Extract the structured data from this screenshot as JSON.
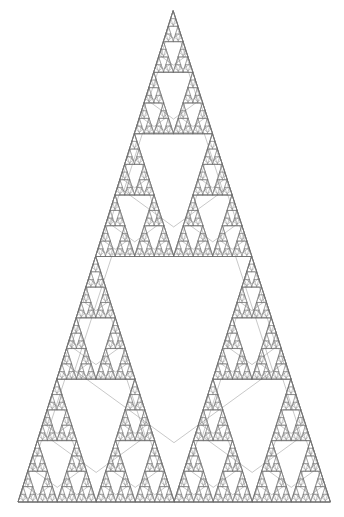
{
  "figure": {
    "type": "fractal-line-drawing",
    "canvas": {
      "width": 344,
      "height": 517,
      "background": "#ffffff"
    },
    "stroke": {
      "color": "#6e6e6e",
      "width": 0.38,
      "linejoin": "round",
      "linecap": "round"
    },
    "geometry": {
      "apex": {
        "x": 173.0,
        "y": 11.0
      },
      "base_left": {
        "x": 18.0,
        "y": 502.0
      },
      "base_right": {
        "x": 330.0,
        "y": 502.0
      },
      "shape": "isosceles-triangle",
      "base_width": 312,
      "height": 491
    },
    "recursion": {
      "depth": 6,
      "rule": "each triangle splits into 3 corner sub-triangles with a central pentagon void",
      "children_per_node": 3,
      "scale_factor": 0.5,
      "pentagon_sides": 5,
      "pentagon_orientation": "point-up"
    },
    "notable_voids": [
      {
        "name": "central-large-pentagon",
        "cx": 176,
        "cy": 398,
        "r": 52
      },
      {
        "name": "upper-mid-pentagon",
        "cx": 174,
        "cy": 275,
        "r": 26
      },
      {
        "name": "left-mid-pentagon",
        "cx": 99,
        "cy": 398,
        "r": 26
      },
      {
        "name": "right-mid-pentagon",
        "cx": 252,
        "cy": 398,
        "r": 26
      },
      {
        "name": "upper-small-pentagon",
        "cx": 173,
        "cy": 152,
        "r": 13
      }
    ]
  }
}
